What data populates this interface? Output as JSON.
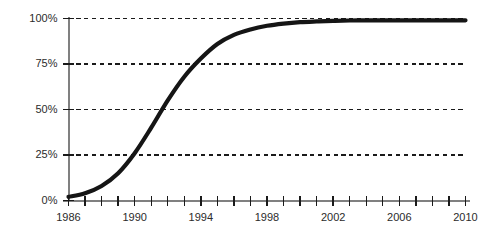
{
  "chart_data": {
    "type": "line",
    "title": "",
    "subtitle": "",
    "xlabel": "",
    "ylabel": "",
    "xlim": [
      1986,
      2010
    ],
    "ylim": [
      0,
      100
    ],
    "grid": true,
    "grid_style": "dashed-horizontal",
    "legend": "none",
    "series": [
      {
        "name": "Adoption",
        "x": [
          1986,
          1987,
          1988,
          1989,
          1990,
          1991,
          1992,
          1993,
          1994,
          1995,
          1996,
          1997,
          1998,
          1999,
          2000,
          2001,
          2002,
          2003,
          2004,
          2005,
          2006,
          2007,
          2008,
          2009,
          2010
        ],
        "values": [
          2,
          4,
          8,
          15,
          26,
          40,
          55,
          68,
          78,
          86,
          91,
          94,
          96,
          97.2,
          98,
          98.4,
          98.7,
          98.9,
          99,
          99,
          99,
          99,
          99,
          99,
          99
        ]
      }
    ],
    "y_ticks": [
      0,
      25,
      50,
      75,
      100
    ],
    "y_tick_labels": [
      "0%",
      "25%",
      "50%",
      "75%",
      "100%"
    ],
    "x_ticks": [
      1986,
      1987,
      1988,
      1989,
      1990,
      1991,
      1992,
      1993,
      1994,
      1995,
      1996,
      1997,
      1998,
      1999,
      2000,
      2001,
      2002,
      2003,
      2004,
      2005,
      2006,
      2007,
      2008,
      2009,
      2010
    ],
    "x_tick_labels_shown": [
      "1986",
      "1990",
      "1994",
      "1998",
      "2002",
      "2006",
      "2010"
    ],
    "x_labeled_ticks": [
      1986,
      1990,
      1994,
      1998,
      2002,
      2006,
      2010
    ],
    "colors": {
      "line": "#151515",
      "axis": "#808080",
      "tick": "#1a1a1a",
      "grid": "#1a1a1a",
      "text": "#2b2b2b",
      "background": "#ffffff"
    },
    "annotations": []
  },
  "y_axis": {
    "labels": [
      {
        "value": 100,
        "text": "100%"
      },
      {
        "value": 75,
        "text": "75%"
      },
      {
        "value": 50,
        "text": "50%"
      },
      {
        "value": 25,
        "text": "25%"
      },
      {
        "value": 0,
        "text": "0%"
      }
    ]
  },
  "x_axis": {
    "labels": [
      {
        "value": 1986,
        "text": "1986"
      },
      {
        "value": 1990,
        "text": "1990"
      },
      {
        "value": 1994,
        "text": "1994"
      },
      {
        "value": 1998,
        "text": "1998"
      },
      {
        "value": 2002,
        "text": "2002"
      },
      {
        "value": 2006,
        "text": "2006"
      },
      {
        "value": 2010,
        "text": "2010"
      }
    ]
  }
}
